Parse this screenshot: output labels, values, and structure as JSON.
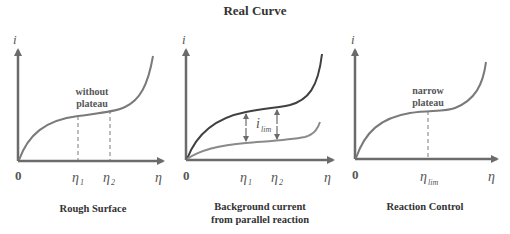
{
  "title": "Real Curve",
  "colors": {
    "axis": "#6b6b6b",
    "curve": "#7a7a7a",
    "curve_dark": "#404040",
    "text": "#333333"
  },
  "panels": [
    {
      "id": "rough-surface",
      "caption": "Rough Surface",
      "y_axis_label": "i",
      "x_axis_label": "η",
      "origin_label": "0",
      "annotation_line1": "without",
      "annotation_line2": "plateau",
      "x_marks": [
        "η1",
        "η2"
      ],
      "x_mark_main": [
        "η",
        "η"
      ],
      "x_mark_sub": [
        "1",
        "2"
      ]
    },
    {
      "id": "background-current",
      "caption_line1": "Background current",
      "caption_line2": "from parallel reaction",
      "y_axis_label": "i",
      "x_axis_label": "η",
      "origin_label": "0",
      "limit_label_main": "i",
      "limit_label_sub": "lim",
      "x_marks": [
        "η1",
        "η2"
      ],
      "x_mark_main": [
        "η",
        "η"
      ],
      "x_mark_sub": [
        "1",
        "2"
      ]
    },
    {
      "id": "reaction-control",
      "caption": "Reaction Control",
      "y_axis_label": "i",
      "x_axis_label": "η",
      "origin_label": "0",
      "annotation_line1": "narrow",
      "annotation_line2": "plateau",
      "x_mark_main": "η",
      "x_mark_sub": "lim"
    }
  ]
}
